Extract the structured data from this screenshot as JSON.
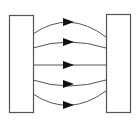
{
  "diagram": {
    "type": "electric-field-lines-between-plates",
    "colors": {
      "plate_stroke": "#555555",
      "plate_fill": "#ffffff",
      "line": "#555555",
      "arrow": "#111111",
      "background": "#ffffff"
    },
    "plates": [
      {
        "name": "left-plate",
        "x": 9,
        "y": 15,
        "width": 24,
        "height": 97
      },
      {
        "name": "right-plate",
        "x": 106,
        "y": 14,
        "width": 24,
        "height": 98
      }
    ],
    "field_lines": [
      {
        "name": "field-line-1",
        "d": "M33,34 Q69,9 106,37",
        "arrow_y": 22
      },
      {
        "name": "field-line-2",
        "d": "M33,48 Q69,36 106,48",
        "arrow_y": 42
      },
      {
        "name": "field-line-3",
        "d": "M33,65 L106,65",
        "arrow_y": 65
      },
      {
        "name": "field-line-4",
        "d": "M33,80 Q69,92 106,80",
        "arrow_y": 84
      },
      {
        "name": "field-line-5",
        "d": "M33,94 Q69,118 106,91",
        "arrow_y": 105
      }
    ],
    "arrow_x": 63,
    "arrow_length": 11,
    "arrow_half_height": 4
  }
}
